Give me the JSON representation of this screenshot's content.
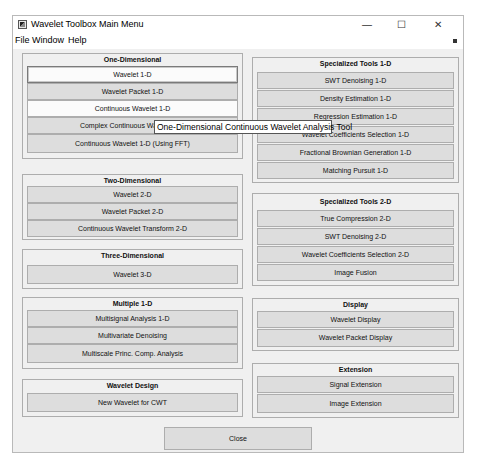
{
  "window": {
    "title": "Wavelet Toolbox Main Menu",
    "controls": {
      "minimize": "—",
      "maximize": "☐",
      "close": "✕"
    }
  },
  "menubar": {
    "items": [
      "File",
      "Window",
      "Help"
    ]
  },
  "tooltip": "One-Dimensional Continuous Wavelet Analysis Tool",
  "left_panels": [
    {
      "title": "One-Dimensional",
      "buttons": [
        "Wavelet 1-D",
        "Wavelet Packet 1-D",
        "Continuous Wavelet 1-D",
        "Complex Continuous Wavelet 1-D",
        "Continuous Wavelet 1-D (Using FFT)"
      ]
    },
    {
      "title": "Two-Dimensional",
      "buttons": [
        "Wavelet 2-D",
        "Wavelet Packet 2-D",
        "Continuous Wavelet Transform 2-D"
      ]
    },
    {
      "title": "Three-Dimensional",
      "buttons": [
        "Wavelet 3-D"
      ]
    },
    {
      "title": "Multiple 1-D",
      "buttons": [
        "Multisignal Analysis 1-D",
        "Multivariate Denoising",
        "Multiscale Princ. Comp. Analysis"
      ]
    },
    {
      "title": "Wavelet Design",
      "buttons": [
        "New Wavelet for CWT"
      ]
    }
  ],
  "right_panels": [
    {
      "title": "Specialized Tools 1-D",
      "buttons": [
        "SWT Denoising 1-D",
        "Density Estimation 1-D",
        "Regression Estimation 1-D",
        "Wavelet Coefficients Selection 1-D",
        "Fractional Brownian Generation 1-D",
        "Matching Pursuit 1-D"
      ]
    },
    {
      "title": "Specialized Tools 2-D",
      "buttons": [
        "True Compression 2-D",
        "SWT Denoising 2-D",
        "Wavelet Coefficients Selection 2-D",
        "Image Fusion"
      ]
    },
    {
      "title": "Display",
      "buttons": [
        "Wavelet Display",
        "Wavelet Packet Display"
      ]
    },
    {
      "title": "Extension",
      "buttons": [
        "Signal Extension",
        "Image Extension"
      ]
    }
  ],
  "close_label": "Close"
}
